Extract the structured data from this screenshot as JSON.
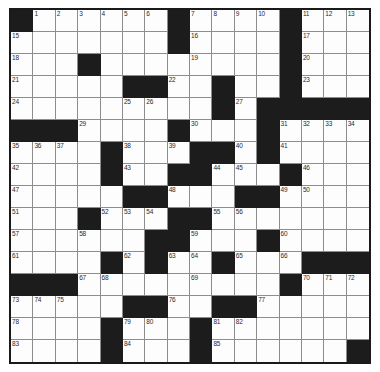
{
  "puzzle": {
    "type": "crossword-grid",
    "rows": 16,
    "cols": 16,
    "colors": {
      "block": "#1c1c1c",
      "cell": "#fdfdfd",
      "gridline": "#8d8d8d",
      "border": "#1a1a1a",
      "number": "#2a2a2a"
    },
    "blocks": [
      [
        0,
        0
      ],
      [
        0,
        7
      ],
      [
        0,
        12
      ],
      [
        1,
        7
      ],
      [
        1,
        12
      ],
      [
        2,
        3
      ],
      [
        2,
        12
      ],
      [
        3,
        5
      ],
      [
        3,
        6
      ],
      [
        3,
        9
      ],
      [
        3,
        12
      ],
      [
        4,
        9
      ],
      [
        4,
        11
      ],
      [
        4,
        12
      ],
      [
        4,
        13
      ],
      [
        4,
        14
      ],
      [
        4,
        15
      ],
      [
        5,
        0
      ],
      [
        5,
        1
      ],
      [
        5,
        2
      ],
      [
        5,
        7
      ],
      [
        5,
        11
      ],
      [
        6,
        4
      ],
      [
        6,
        8
      ],
      [
        6,
        9
      ],
      [
        6,
        11
      ],
      [
        7,
        4
      ],
      [
        7,
        7
      ],
      [
        7,
        8
      ],
      [
        7,
        12
      ],
      [
        8,
        5
      ],
      [
        8,
        6
      ],
      [
        8,
        10
      ],
      [
        8,
        11
      ],
      [
        9,
        3
      ],
      [
        9,
        7
      ],
      [
        9,
        8
      ],
      [
        10,
        6
      ],
      [
        10,
        7
      ],
      [
        10,
        11
      ],
      [
        11,
        4
      ],
      [
        11,
        6
      ],
      [
        11,
        9
      ],
      [
        11,
        13
      ],
      [
        11,
        14
      ],
      [
        11,
        15
      ],
      [
        12,
        0
      ],
      [
        12,
        1
      ],
      [
        12,
        2
      ],
      [
        12,
        12
      ],
      [
        13,
        5
      ],
      [
        13,
        6
      ],
      [
        13,
        9
      ],
      [
        13,
        10
      ],
      [
        14,
        4
      ],
      [
        14,
        8
      ],
      [
        15,
        4
      ],
      [
        15,
        8
      ],
      [
        15,
        15
      ]
    ],
    "numbers": [
      {
        "row": 0,
        "col": 1,
        "label": "1"
      },
      {
        "row": 0,
        "col": 2,
        "label": "2"
      },
      {
        "row": 0,
        "col": 3,
        "label": "3"
      },
      {
        "row": 0,
        "col": 4,
        "label": "4"
      },
      {
        "row": 0,
        "col": 5,
        "label": "5"
      },
      {
        "row": 0,
        "col": 6,
        "label": "6"
      },
      {
        "row": 0,
        "col": 8,
        "label": "7"
      },
      {
        "row": 0,
        "col": 9,
        "label": "8"
      },
      {
        "row": 0,
        "col": 10,
        "label": "9"
      },
      {
        "row": 0,
        "col": 11,
        "label": "10"
      },
      {
        "row": 0,
        "col": 13,
        "label": "11"
      },
      {
        "row": 0,
        "col": 14,
        "label": "12"
      },
      {
        "row": 0,
        "col": 15,
        "label": "13"
      },
      {
        "row": 1,
        "col": 0,
        "label": "15"
      },
      {
        "row": 1,
        "col": 8,
        "label": "16"
      },
      {
        "row": 1,
        "col": 13,
        "label": "17"
      },
      {
        "row": 2,
        "col": 0,
        "label": "18"
      },
      {
        "row": 2,
        "col": 8,
        "label": "19"
      },
      {
        "row": 2,
        "col": 13,
        "label": "20"
      },
      {
        "row": 3,
        "col": 0,
        "label": "21"
      },
      {
        "row": 3,
        "col": 7,
        "label": "22"
      },
      {
        "row": 3,
        "col": 13,
        "label": "23"
      },
      {
        "row": 4,
        "col": 0,
        "label": "24"
      },
      {
        "row": 4,
        "col": 5,
        "label": "25"
      },
      {
        "row": 4,
        "col": 6,
        "label": "26"
      },
      {
        "row": 4,
        "col": 10,
        "label": "27"
      },
      {
        "row": 4,
        "col": 11,
        "label": "28"
      },
      {
        "row": 5,
        "col": 3,
        "label": "29"
      },
      {
        "row": 5,
        "col": 8,
        "label": "30"
      },
      {
        "row": 5,
        "col": 12,
        "label": "31"
      },
      {
        "row": 5,
        "col": 13,
        "label": "32"
      },
      {
        "row": 5,
        "col": 14,
        "label": "33"
      },
      {
        "row": 5,
        "col": 15,
        "label": "34"
      },
      {
        "row": 6,
        "col": 0,
        "label": "35"
      },
      {
        "row": 6,
        "col": 1,
        "label": "36"
      },
      {
        "row": 6,
        "col": 2,
        "label": "37"
      },
      {
        "row": 6,
        "col": 5,
        "label": "38"
      },
      {
        "row": 6,
        "col": 7,
        "label": "39"
      },
      {
        "row": 6,
        "col": 10,
        "label": "40"
      },
      {
        "row": 6,
        "col": 12,
        "label": "41"
      },
      {
        "row": 7,
        "col": 0,
        "label": "42"
      },
      {
        "row": 7,
        "col": 5,
        "label": "43"
      },
      {
        "row": 7,
        "col": 9,
        "label": "44"
      },
      {
        "row": 7,
        "col": 10,
        "label": "45"
      },
      {
        "row": 7,
        "col": 13,
        "label": "46"
      },
      {
        "row": 8,
        "col": 0,
        "label": "47"
      },
      {
        "row": 8,
        "col": 7,
        "label": "48"
      },
      {
        "row": 8,
        "col": 12,
        "label": "49"
      },
      {
        "row": 8,
        "col": 13,
        "label": "50"
      },
      {
        "row": 9,
        "col": 0,
        "label": "51"
      },
      {
        "row": 9,
        "col": 4,
        "label": "52"
      },
      {
        "row": 9,
        "col": 5,
        "label": "53"
      },
      {
        "row": 9,
        "col": 6,
        "label": "54"
      },
      {
        "row": 9,
        "col": 9,
        "label": "55"
      },
      {
        "row": 9,
        "col": 10,
        "label": "56"
      },
      {
        "row": 10,
        "col": 0,
        "label": "57"
      },
      {
        "row": 10,
        "col": 3,
        "label": "58"
      },
      {
        "row": 10,
        "col": 8,
        "label": "59"
      },
      {
        "row": 10,
        "col": 12,
        "label": "60"
      },
      {
        "row": 11,
        "col": 0,
        "label": "61"
      },
      {
        "row": 11,
        "col": 5,
        "label": "62"
      },
      {
        "row": 11,
        "col": 7,
        "label": "63"
      },
      {
        "row": 11,
        "col": 8,
        "label": "64"
      },
      {
        "row": 11,
        "col": 10,
        "label": "65"
      },
      {
        "row": 11,
        "col": 12,
        "label": "66"
      },
      {
        "row": 12,
        "col": 3,
        "label": "67"
      },
      {
        "row": 12,
        "col": 4,
        "label": "68"
      },
      {
        "row": 12,
        "col": 8,
        "label": "69"
      },
      {
        "row": 12,
        "col": 13,
        "label": "70"
      },
      {
        "row": 12,
        "col": 14,
        "label": "71"
      },
      {
        "row": 12,
        "col": 15,
        "label": "72"
      },
      {
        "row": 13,
        "col": 0,
        "label": "73"
      },
      {
        "row": 13,
        "col": 1,
        "label": "74"
      },
      {
        "row": 13,
        "col": 2,
        "label": "75"
      },
      {
        "row": 13,
        "col": 7,
        "label": "76"
      },
      {
        "row": 13,
        "col": 11,
        "label": "77"
      },
      {
        "row": 14,
        "col": 0,
        "label": "78"
      },
      {
        "row": 14,
        "col": 5,
        "label": "79"
      },
      {
        "row": 14,
        "col": 6,
        "label": "80"
      },
      {
        "row": 14,
        "col": 9,
        "label": "81"
      },
      {
        "row": 14,
        "col": 10,
        "label": "82"
      },
      {
        "row": 15,
        "col": 0,
        "label": "83"
      },
      {
        "row": 15,
        "col": 5,
        "label": "84"
      },
      {
        "row": 15,
        "col": 9,
        "label": "85"
      }
    ],
    "extra_numbers": [
      {
        "row": 0,
        "col": 16,
        "label": "14"
      },
      {
        "row": 16,
        "col": 0,
        "label": "86"
      },
      {
        "row": 16,
        "col": 5,
        "label": "87"
      },
      {
        "row": 16,
        "col": 9,
        "label": "88"
      }
    ]
  }
}
